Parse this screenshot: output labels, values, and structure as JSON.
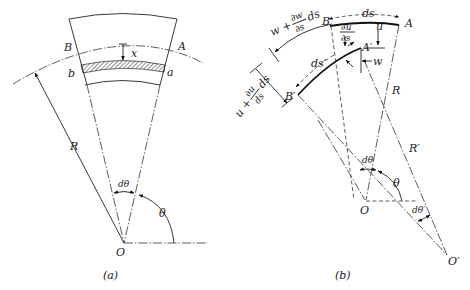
{
  "figure_a": {
    "caption": "(a)",
    "labels": {
      "A": "A",
      "B": "B",
      "a": "a",
      "b": "b",
      "x": "x",
      "R": "R",
      "O": "O",
      "dtheta": "dθ",
      "theta": "θ"
    }
  },
  "figure_b": {
    "caption": "(b)",
    "labels": {
      "A": "A",
      "B": "B",
      "A_prime": "A′",
      "B_prime": "B′",
      "ds": "ds",
      "ds_prime": "ds′",
      "u": "u",
      "w": "w",
      "R": "R",
      "R_prime": "R′",
      "O": "O",
      "O_prime": "O′",
      "dtheta": "dθ",
      "dtheta_prime": "dθ′",
      "theta": "θ",
      "du_ds_num": "∂u",
      "du_ds_den": "∂s",
      "w_plus": "w +",
      "dw_num": "∂w",
      "dw_den": "∂s",
      "dw_ds": "ds",
      "u_plus": "u +",
      "du_num": "∂u",
      "du_den": "ds",
      "du_ds": "ds"
    }
  }
}
